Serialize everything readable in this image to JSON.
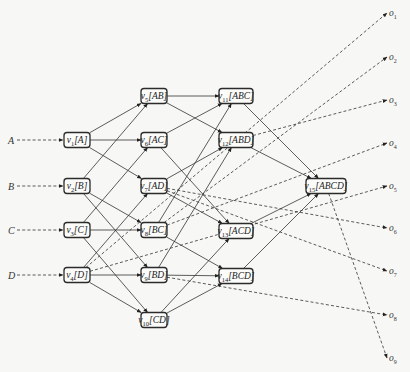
{
  "diagram": {
    "type": "layered-dag",
    "inputs": [
      {
        "id": "A",
        "label": "A",
        "x": 38,
        "y": 140
      },
      {
        "id": "B",
        "label": "B",
        "x": 38,
        "y": 186
      },
      {
        "id": "C",
        "label": "C",
        "x": 38,
        "y": 230
      },
      {
        "id": "D",
        "label": "D",
        "x": 38,
        "y": 275
      }
    ],
    "nodes": [
      {
        "id": "v1",
        "name": "v",
        "sub": "1",
        "set": "[A]",
        "x": 77,
        "y": 140,
        "w": 26,
        "h": 15
      },
      {
        "id": "v2",
        "name": "v",
        "sub": "2",
        "set": "[B]",
        "x": 77,
        "y": 186,
        "w": 26,
        "h": 15
      },
      {
        "id": "v3",
        "name": "v",
        "sub": "3",
        "set": "[C]",
        "x": 77,
        "y": 230,
        "w": 26,
        "h": 15
      },
      {
        "id": "v4",
        "name": "v",
        "sub": "4",
        "set": "[D]",
        "x": 77,
        "y": 275,
        "w": 26,
        "h": 15
      },
      {
        "id": "v5",
        "name": "v",
        "sub": "5",
        "set": "[AB]",
        "x": 154,
        "y": 96,
        "w": 26,
        "h": 15
      },
      {
        "id": "v6",
        "name": "v",
        "sub": "6",
        "set": "[AC]",
        "x": 154,
        "y": 140,
        "w": 26,
        "h": 15
      },
      {
        "id": "v7",
        "name": "v",
        "sub": "7",
        "set": "[AD]",
        "x": 154,
        "y": 186,
        "w": 26,
        "h": 15
      },
      {
        "id": "v8",
        "name": "v",
        "sub": "8",
        "set": "[BC]",
        "x": 154,
        "y": 230,
        "w": 26,
        "h": 15
      },
      {
        "id": "v9",
        "name": "v",
        "sub": "9",
        "set": "[BD]",
        "x": 154,
        "y": 275,
        "w": 26,
        "h": 15
      },
      {
        "id": "v10",
        "name": "v",
        "sub": "10",
        "set": "[CD]",
        "x": 154,
        "y": 320,
        "w": 26,
        "h": 15
      },
      {
        "id": "v11",
        "name": "v",
        "sub": "11",
        "set": "[ABC]",
        "x": 236,
        "y": 96,
        "w": 34,
        "h": 15
      },
      {
        "id": "v12",
        "name": "v",
        "sub": "12",
        "set": "[ABD]",
        "x": 236,
        "y": 140,
        "w": 34,
        "h": 15
      },
      {
        "id": "v13",
        "name": "v",
        "sub": "13",
        "set": "[ACD]",
        "x": 236,
        "y": 231,
        "w": 34,
        "h": 15
      },
      {
        "id": "v14",
        "name": "v",
        "sub": "14",
        "set": "[BCD]",
        "x": 236,
        "y": 276,
        "w": 34,
        "h": 15
      },
      {
        "id": "v15",
        "name": "v",
        "sub": "15",
        "set": "[ABCD]",
        "x": 326,
        "y": 186,
        "w": 40,
        "h": 15
      }
    ],
    "edges": [
      [
        "v1",
        "v5"
      ],
      [
        "v1",
        "v6"
      ],
      [
        "v1",
        "v7"
      ],
      [
        "v2",
        "v5"
      ],
      [
        "v2",
        "v8"
      ],
      [
        "v2",
        "v9"
      ],
      [
        "v3",
        "v6"
      ],
      [
        "v3",
        "v8"
      ],
      [
        "v3",
        "v10"
      ],
      [
        "v4",
        "v7"
      ],
      [
        "v4",
        "v9"
      ],
      [
        "v4",
        "v10"
      ],
      [
        "v5",
        "v11"
      ],
      [
        "v5",
        "v12"
      ],
      [
        "v6",
        "v11"
      ],
      [
        "v6",
        "v13"
      ],
      [
        "v7",
        "v12"
      ],
      [
        "v7",
        "v13"
      ],
      [
        "v8",
        "v11"
      ],
      [
        "v8",
        "v14"
      ],
      [
        "v9",
        "v12"
      ],
      [
        "v9",
        "v14"
      ],
      [
        "v10",
        "v13"
      ],
      [
        "v10",
        "v14"
      ],
      [
        "v11",
        "v15"
      ],
      [
        "v12",
        "v15"
      ],
      [
        "v13",
        "v15"
      ],
      [
        "v14",
        "v15"
      ]
    ],
    "outputs": [
      {
        "id": "o1",
        "name": "o",
        "sub": "1",
        "x": 396,
        "y": 13,
        "from": "v4"
      },
      {
        "id": "o2",
        "name": "o",
        "sub": "2",
        "x": 396,
        "y": 57,
        "from": "v8"
      },
      {
        "id": "o3",
        "name": "o",
        "sub": "3",
        "x": 396,
        "y": 100,
        "from": "v12"
      },
      {
        "id": "o4",
        "name": "o",
        "sub": "4",
        "x": 396,
        "y": 143,
        "from": "v8"
      },
      {
        "id": "o5",
        "name": "o",
        "sub": "5",
        "x": 396,
        "y": 186,
        "from": "v4"
      },
      {
        "id": "o6",
        "name": "o",
        "sub": "6",
        "x": 396,
        "y": 228,
        "from": "v7"
      },
      {
        "id": "o7",
        "name": "o",
        "sub": "7",
        "x": 396,
        "y": 271,
        "from": "v7"
      },
      {
        "id": "o8",
        "name": "o",
        "sub": "8",
        "x": 396,
        "y": 315,
        "from": "v9"
      },
      {
        "id": "o9",
        "name": "o",
        "sub": "9",
        "x": 396,
        "y": 358,
        "from": "v15"
      }
    ],
    "colors": {
      "stroke": "#2b2b2b",
      "background": "#f7f7f5",
      "node_fill": "#fbfbfa"
    }
  }
}
